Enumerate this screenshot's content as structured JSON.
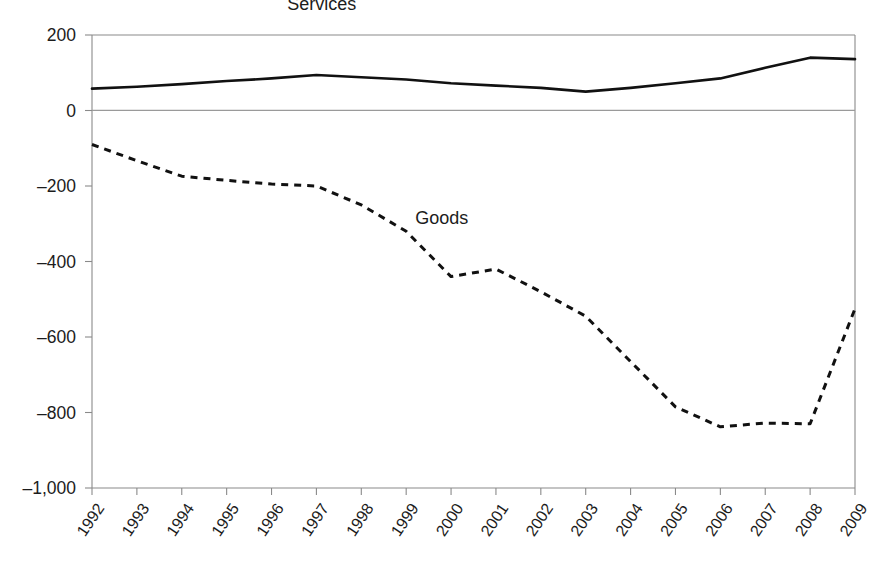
{
  "chart_data": {
    "type": "line",
    "title": "",
    "subtitle": "",
    "xlabel": "",
    "ylabel": "",
    "categories": [
      "1992",
      "1993",
      "1994",
      "1995",
      "1996",
      "1997",
      "1998",
      "1999",
      "2000",
      "2001",
      "2002",
      "2003",
      "2004",
      "2005",
      "2006",
      "2007",
      "2008",
      "2009"
    ],
    "xlim": [
      1992,
      2009
    ],
    "ylim": [
      -1000,
      200
    ],
    "yticks": [
      200,
      0,
      -200,
      -400,
      -600,
      -800,
      -1000
    ],
    "ytick_labels": [
      "200",
      "0",
      "–200",
      "–400",
      "–600",
      "–800",
      "–1,000"
    ],
    "grid": false,
    "legend_position": "inline-annotation",
    "series": [
      {
        "name": "Services",
        "style": "solid",
        "color": "#111111",
        "label_anchor": {
          "x": 1996.35,
          "y": 265
        },
        "values": [
          58,
          63,
          70,
          78,
          85,
          94,
          88,
          82,
          72,
          66,
          60,
          50,
          60,
          72,
          85,
          113,
          140,
          136
        ]
      },
      {
        "name": "Goods",
        "style": "dashed",
        "color": "#111111",
        "label_anchor": {
          "x": 1999.2,
          "y": -300
        },
        "values": [
          -90,
          -133,
          -174,
          -185,
          -195,
          -200,
          -250,
          -320,
          -440,
          -420,
          -480,
          -545,
          -665,
          -785,
          -838,
          -828,
          -830,
          -525
        ]
      }
    ]
  },
  "annotations": [
    {
      "name": "series-label-services",
      "text": "Services"
    },
    {
      "name": "series-label-goods",
      "text": "Goods"
    }
  ]
}
